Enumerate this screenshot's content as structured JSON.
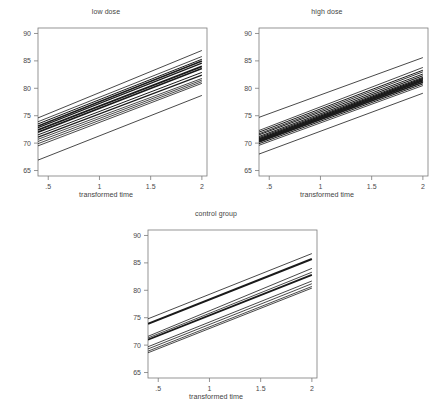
{
  "figure": {
    "background": "#ffffff",
    "axis_color": "#7a7a7a",
    "line_color": "#1a1a1a",
    "caption": ""
  },
  "chart_data": {
    "type": "line",
    "title": "",
    "layout": "three panels: low dose (top-left), high dose (top-right), control group (bottom-center)",
    "xlabel": "transformed time",
    "ylabel": "",
    "xlim": [
      0.4,
      2.05
    ],
    "ylim": [
      64.0,
      91.0
    ],
    "xticks": [
      0.5,
      1,
      1.5,
      2
    ],
    "xticklabels": [
      ".5",
      "1",
      "1.5",
      "2"
    ],
    "yticks": [
      65,
      70,
      75,
      80,
      85,
      90
    ],
    "yticklabels": [
      "65",
      "70",
      "75",
      "80",
      "85",
      "90"
    ],
    "grid": false,
    "legend": "none",
    "panels": [
      {
        "name": "low-dose",
        "title": "low dose",
        "xlabel": "transformed time",
        "series": [
          {
            "name": "subject-1",
            "x": [
              0.4,
              2.0
            ],
            "y": [
              74.6,
              86.9
            ],
            "width": 0.8
          },
          {
            "name": "subject-2",
            "x": [
              0.4,
              2.0
            ],
            "y": [
              73.9,
              85.8
            ],
            "width": 0.8
          },
          {
            "name": "subject-3",
            "x": [
              0.4,
              2.0
            ],
            "y": [
              73.5,
              85.3
            ],
            "width": 1.0
          },
          {
            "name": "subject-4",
            "x": [
              0.4,
              2.0
            ],
            "y": [
              73.1,
              85.0
            ],
            "width": 1.6
          },
          {
            "name": "subject-5",
            "x": [
              0.4,
              2.0
            ],
            "y": [
              72.8,
              84.6
            ],
            "width": 1.2
          },
          {
            "name": "subject-6",
            "x": [
              0.4,
              2.0
            ],
            "y": [
              72.4,
              84.0
            ],
            "width": 1.8
          },
          {
            "name": "subject-7",
            "x": [
              0.4,
              2.0
            ],
            "y": [
              72.0,
              83.6
            ],
            "width": 1.6
          },
          {
            "name": "subject-8",
            "x": [
              0.4,
              2.0
            ],
            "y": [
              71.5,
              82.9
            ],
            "width": 1.0
          },
          {
            "name": "subject-9",
            "x": [
              0.4,
              2.0
            ],
            "y": [
              71.1,
              82.4
            ],
            "width": 1.2
          },
          {
            "name": "subject-10",
            "x": [
              0.4,
              2.0
            ],
            "y": [
              70.7,
              81.8
            ],
            "width": 0.8
          },
          {
            "name": "subject-11",
            "x": [
              0.4,
              2.0
            ],
            "y": [
              70.3,
              81.5
            ],
            "width": 0.8
          },
          {
            "name": "subject-12",
            "x": [
              0.4,
              2.0
            ],
            "y": [
              69.9,
              81.2
            ],
            "width": 0.8
          },
          {
            "name": "subject-13",
            "x": [
              0.4,
              2.0
            ],
            "y": [
              69.5,
              80.9
            ],
            "width": 0.8
          },
          {
            "name": "subject-14",
            "x": [
              0.4,
              2.0
            ],
            "y": [
              66.9,
              78.7
            ],
            "width": 0.8
          }
        ]
      },
      {
        "name": "high-dose",
        "title": "high dose",
        "xlabel": "transformed time",
        "series": [
          {
            "name": "subject-1",
            "x": [
              0.4,
              2.0
            ],
            "y": [
              74.7,
              85.6
            ],
            "width": 0.8
          },
          {
            "name": "subject-2",
            "x": [
              0.4,
              2.0
            ],
            "y": [
              72.3,
              83.8
            ],
            "width": 0.8
          },
          {
            "name": "subject-3",
            "x": [
              0.4,
              2.0
            ],
            "y": [
              72.0,
              83.3
            ],
            "width": 1.0
          },
          {
            "name": "subject-4",
            "x": [
              0.4,
              2.0
            ],
            "y": [
              71.7,
              83.0
            ],
            "width": 0.9
          },
          {
            "name": "subject-5",
            "x": [
              0.4,
              2.0
            ],
            "y": [
              71.5,
              82.6
            ],
            "width": 1.0
          },
          {
            "name": "subject-6",
            "x": [
              0.4,
              2.0
            ],
            "y": [
              71.2,
              82.3
            ],
            "width": 1.2
          },
          {
            "name": "subject-7",
            "x": [
              0.4,
              2.0
            ],
            "y": [
              71.0,
              82.0
            ],
            "width": 1.0
          },
          {
            "name": "subject-8",
            "x": [
              0.4,
              2.0
            ],
            "y": [
              70.8,
              81.8
            ],
            "width": 1.4
          },
          {
            "name": "subject-9",
            "x": [
              0.4,
              2.0
            ],
            "y": [
              70.6,
              81.6
            ],
            "width": 1.6
          },
          {
            "name": "subject-10",
            "x": [
              0.4,
              2.0
            ],
            "y": [
              70.4,
              81.4
            ],
            "width": 2.0
          },
          {
            "name": "subject-11",
            "x": [
              0.4,
              2.0
            ],
            "y": [
              70.2,
              81.1
            ],
            "width": 1.8
          },
          {
            "name": "subject-12",
            "x": [
              0.4,
              2.0
            ],
            "y": [
              69.9,
              80.8
            ],
            "width": 1.0
          },
          {
            "name": "subject-13",
            "x": [
              0.4,
              2.0
            ],
            "y": [
              69.6,
              80.5
            ],
            "width": 0.8
          },
          {
            "name": "subject-14",
            "x": [
              0.4,
              2.0
            ],
            "y": [
              68.0,
              79.1
            ],
            "width": 0.8
          }
        ]
      },
      {
        "name": "control-group",
        "title": "control group",
        "xlabel": "transformed time",
        "series": [
          {
            "name": "subject-1",
            "x": [
              0.4,
              2.0
            ],
            "y": [
              74.8,
              86.7
            ],
            "width": 0.8
          },
          {
            "name": "subject-2",
            "x": [
              0.4,
              2.0
            ],
            "y": [
              73.9,
              85.7
            ],
            "width": 2.0
          },
          {
            "name": "subject-3",
            "x": [
              0.4,
              2.0
            ],
            "y": [
              71.6,
              84.0
            ],
            "width": 0.8
          },
          {
            "name": "subject-4",
            "x": [
              0.4,
              2.0
            ],
            "y": [
              71.3,
              83.3
            ],
            "width": 0.8
          },
          {
            "name": "subject-5",
            "x": [
              0.4,
              2.0
            ],
            "y": [
              71.0,
              82.8
            ],
            "width": 1.8
          },
          {
            "name": "subject-6",
            "x": [
              0.4,
              2.0
            ],
            "y": [
              69.7,
              81.7
            ],
            "width": 0.8
          },
          {
            "name": "subject-7",
            "x": [
              0.4,
              2.0
            ],
            "y": [
              69.3,
              81.2
            ],
            "width": 0.8
          },
          {
            "name": "subject-8",
            "x": [
              0.4,
              2.0
            ],
            "y": [
              68.9,
              80.7
            ],
            "width": 0.8
          },
          {
            "name": "subject-9",
            "x": [
              0.4,
              2.0
            ],
            "y": [
              68.6,
              80.4
            ],
            "width": 0.8
          }
        ]
      }
    ]
  }
}
